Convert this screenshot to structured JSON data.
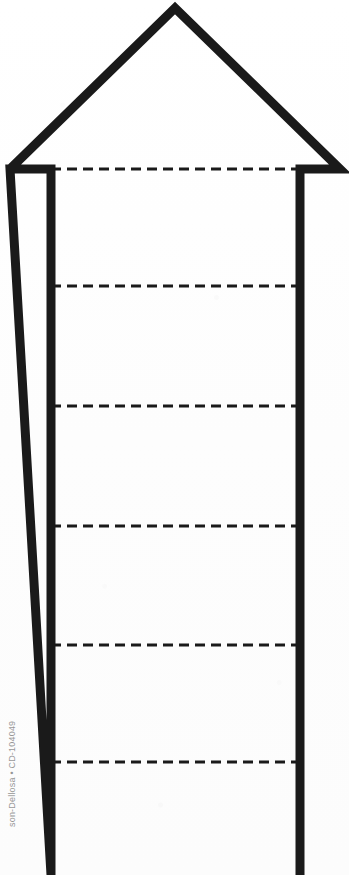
{
  "page": {
    "width": 349,
    "height": 875,
    "background_color": "#fefefe",
    "ink_color": "#1a1a1a",
    "document_type": "printable-worksheet-scan"
  },
  "watermark": {
    "text": "son-Dellosa • CD-104049",
    "full_text_guess": "Carson-Dellosa • CD-104049",
    "orientation": "rotated-90-ccw",
    "color": "#6f6f6f",
    "clipped": "left edge cut off"
  },
  "figure": {
    "name": "segmented-upward-arrow",
    "stroke_color": "#1a1a1a",
    "stroke_width": 9,
    "outline": {
      "apex": [
        175,
        8
      ],
      "left_barb_tip": [
        10,
        169
      ],
      "left_shoulder": [
        51,
        169
      ],
      "right_shoulder": [
        300,
        169
      ],
      "right_barb_tip": [
        340,
        169
      ],
      "shaft_left_x": 51,
      "shaft_right_x": 300,
      "shaft_bottom_y": 875,
      "shaft_clipped_at_bottom": true
    },
    "dashed_lines": {
      "count": 6,
      "color": "#1a1a1a",
      "dash_length": 10,
      "dash_gap": 6,
      "thickness": 3,
      "x_start": 51,
      "x_end": 300,
      "y_positions": [
        169,
        286,
        406,
        526,
        645,
        762
      ]
    }
  }
}
